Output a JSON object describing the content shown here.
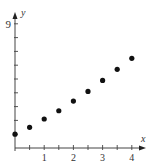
{
  "chart_data": {
    "type": "scatter",
    "title": "",
    "xlabel": "x",
    "ylabel": "y",
    "x_tick_labels": [
      "1",
      "2",
      "3",
      "4"
    ],
    "y_tick_labels": [
      "9"
    ],
    "xlim": [
      0,
      4.5
    ],
    "ylim": [
      0,
      9.5
    ],
    "x_tick_step": 0.5,
    "y_tick_step": 1,
    "grid": false,
    "legend": null,
    "series": [
      {
        "name": "points",
        "color": "#111111",
        "x": [
          0,
          0.5,
          1,
          1.5,
          2,
          2.5,
          3,
          3.5,
          4
        ],
        "y": [
          1.0,
          1.5,
          2.1,
          2.7,
          3.4,
          4.1,
          4.9,
          5.7,
          6.5
        ]
      }
    ]
  },
  "axes": {
    "x_label": "x",
    "y_label": "y",
    "x_ticks": [
      {
        "value": 1,
        "label": "1"
      },
      {
        "value": 2,
        "label": "2"
      },
      {
        "value": 3,
        "label": "3"
      },
      {
        "value": 4,
        "label": "4"
      }
    ],
    "y_ticks": [
      {
        "value": 9,
        "label": "9"
      }
    ]
  },
  "colors": {
    "axis": "#444444",
    "point": "#111111",
    "text": "#333333"
  }
}
